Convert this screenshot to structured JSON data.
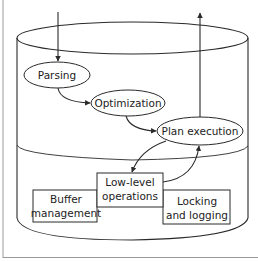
{
  "diagram": {
    "type": "database-system-architecture",
    "colors": {
      "line": "#2a2a2a",
      "frame": "#9a9a9a",
      "background": "#ffffff"
    },
    "nodes": {
      "parsing": {
        "label": "Parsing",
        "shape": "ellipse"
      },
      "optimization": {
        "label": "Optimization",
        "shape": "ellipse"
      },
      "plan_execution": {
        "label": "Plan execution",
        "shape": "ellipse"
      },
      "low_level": {
        "line1": "Low-level",
        "line2": "operations",
        "shape": "box"
      },
      "buffer": {
        "line1": "Buffer",
        "line2": "management",
        "shape": "box"
      },
      "locking": {
        "line1": "Locking",
        "line2": "and logging",
        "shape": "box"
      }
    },
    "edges": [
      {
        "from": "input",
        "to": "parsing"
      },
      {
        "from": "parsing",
        "to": "optimization"
      },
      {
        "from": "optimization",
        "to": "plan_execution"
      },
      {
        "from": "plan_execution",
        "to": "low_level"
      },
      {
        "from": "low_level",
        "to": "plan_execution"
      },
      {
        "from": "plan_execution",
        "to": "output"
      }
    ]
  }
}
